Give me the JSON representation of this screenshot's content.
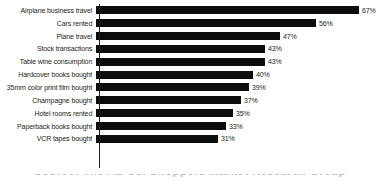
{
  "chart_data": {
    "type": "bar",
    "orientation": "horizontal",
    "title": "",
    "xlabel": "",
    "ylabel": "",
    "xlim": [
      0,
      67
    ],
    "grid": false,
    "legend": null,
    "value_suffix": "%",
    "categories": [
      "Airplane business travel",
      "Cars rented",
      "Plane travel",
      "Stock transactions",
      "Table wine consumption",
      "Hardcover books bought",
      "35mm color print film bought",
      "Champagne bought",
      "Hotel rooms rented",
      "Paperback books bought",
      "VCR tapes bought"
    ],
    "values": [
      67,
      56,
      47,
      43,
      43,
      40,
      39,
      37,
      35,
      33,
      31
    ],
    "value_labels": [
      "67%",
      "56%",
      "47%",
      "43%",
      "43%",
      "40%",
      "39%",
      "37%",
      "35%",
      "33%",
      "31%"
    ],
    "bar_color": "#0d0d0d",
    "background_color": "#ffffff",
    "axis_color": "#1a1a1a"
  },
  "footer": {
    "clipped_caption": "Source: The Ad Co. Shoppers Market Research Group"
  }
}
